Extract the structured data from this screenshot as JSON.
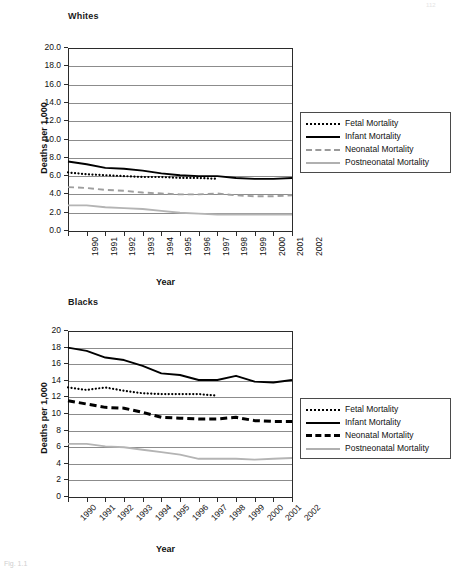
{
  "page": {
    "corner_mark": "112",
    "caption": "Fig. 1.1"
  },
  "charts": [
    {
      "id": "whites",
      "title": "Whites",
      "ylabel": "Deaths per 1,000",
      "xlabel": "Year",
      "yticks": [
        "0.0",
        "2.0",
        "4.0",
        "6.0",
        "8.0",
        "10.0",
        "12.0",
        "14.0",
        "16.0",
        "18.0",
        "20.0"
      ],
      "legend": [
        {
          "label": "Fetal Mortality",
          "style": "sw-fetal"
        },
        {
          "label": "Infant Mortality",
          "style": "sw-infant"
        },
        {
          "label": "Neonatal Mortality",
          "style": "sw-neo-gray"
        },
        {
          "label": "Postneonatal Mortality",
          "style": "sw-post"
        }
      ]
    },
    {
      "id": "blacks",
      "title": "Blacks",
      "ylabel": "Deaths per 1,000",
      "xlabel": "Year",
      "yticks": [
        "0",
        "2",
        "4",
        "6",
        "8",
        "10",
        "12",
        "14",
        "16",
        "18",
        "20"
      ],
      "legend": [
        {
          "label": "Fetal Mortality",
          "style": "sw-fetal"
        },
        {
          "label": "Infant Mortality",
          "style": "sw-infant"
        },
        {
          "label": "Neonatal Mortality",
          "style": "sw-neo-black"
        },
        {
          "label": "Postneonatal Mortality",
          "style": "sw-post"
        }
      ]
    }
  ],
  "chart_data": [
    {
      "type": "line",
      "title": "Whites",
      "xlabel": "Year",
      "ylabel": "Deaths per 1,000",
      "x": [
        1990,
        1991,
        1992,
        1993,
        1994,
        1995,
        1996,
        1997,
        1998,
        1999,
        2000,
        2001,
        2002
      ],
      "xlim": [
        1990,
        2002
      ],
      "ylim": [
        0.0,
        20.0
      ],
      "ytick_step": 2.0,
      "grid": "horizontal",
      "legend_position": "right",
      "series": [
        {
          "name": "Fetal Mortality",
          "style": "dotted-black",
          "values": [
            6.4,
            6.2,
            6.1,
            6.0,
            5.9,
            5.9,
            5.8,
            5.8,
            5.7,
            null,
            null,
            null,
            null
          ]
        },
        {
          "name": "Infant Mortality",
          "style": "solid-black",
          "values": [
            7.6,
            7.3,
            6.9,
            6.8,
            6.6,
            6.3,
            6.1,
            6.0,
            6.0,
            5.8,
            5.7,
            5.7,
            5.8
          ]
        },
        {
          "name": "Neonatal Mortality",
          "style": "dashed-gray",
          "values": [
            4.8,
            4.7,
            4.5,
            4.4,
            4.2,
            4.1,
            4.0,
            4.0,
            4.1,
            3.9,
            3.8,
            3.8,
            3.9
          ]
        },
        {
          "name": "Postneonatal Mortality",
          "style": "solid-lightgray",
          "values": [
            2.8,
            2.8,
            2.6,
            2.5,
            2.4,
            2.2,
            2.0,
            1.9,
            1.8,
            1.8,
            1.8,
            1.8,
            1.8
          ]
        }
      ]
    },
    {
      "type": "line",
      "title": "Blacks",
      "xlabel": "Year",
      "ylabel": "Deaths per 1,000",
      "x": [
        1990,
        1991,
        1992,
        1993,
        1994,
        1995,
        1996,
        1997,
        1998,
        1999,
        2000,
        2001,
        2002
      ],
      "xlim": [
        1990,
        2002
      ],
      "ylim": [
        0,
        20
      ],
      "ytick_step": 2,
      "grid": "horizontal",
      "legend_position": "right",
      "series": [
        {
          "name": "Fetal Mortality",
          "style": "dotted-black",
          "values": [
            13.2,
            12.9,
            13.2,
            12.8,
            12.5,
            12.4,
            12.4,
            12.4,
            12.2,
            null,
            null,
            null,
            null
          ]
        },
        {
          "name": "Infant Mortality",
          "style": "solid-black",
          "values": [
            18.0,
            17.6,
            16.8,
            16.5,
            15.8,
            14.9,
            14.7,
            14.1,
            14.1,
            14.6,
            13.9,
            13.8,
            14.1
          ]
        },
        {
          "name": "Neonatal Mortality",
          "style": "dashed-black-bold",
          "values": [
            11.6,
            11.2,
            10.8,
            10.7,
            10.2,
            9.6,
            9.5,
            9.4,
            9.4,
            9.6,
            9.2,
            9.1,
            9.1
          ]
        },
        {
          "name": "Postneonatal Mortality",
          "style": "solid-lightgray",
          "values": [
            6.4,
            6.4,
            6.1,
            6.0,
            5.7,
            5.4,
            5.1,
            4.6,
            4.6,
            4.6,
            4.5,
            4.6,
            4.7
          ]
        }
      ]
    }
  ]
}
